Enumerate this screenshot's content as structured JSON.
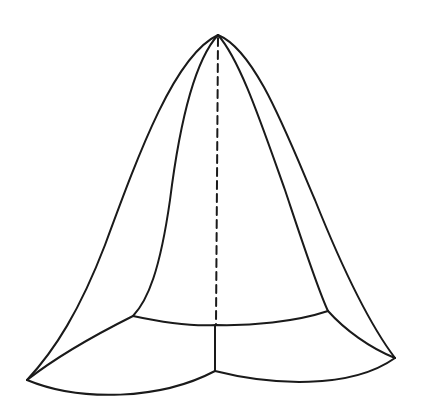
{
  "figure": {
    "type": "line-drawing",
    "stroke_color": "#1a1a1a",
    "background": "#ffffff",
    "stroke_width": 2,
    "points": {
      "apex": [
        218,
        35
      ],
      "left_corner": [
        27,
        380
      ],
      "right_corner": [
        395,
        358
      ],
      "front_bottom": [
        215,
        371
      ],
      "inner_left": [
        133,
        316
      ],
      "inner_right": [
        328,
        311
      ],
      "hidden_base": [
        216,
        324
      ]
    }
  }
}
